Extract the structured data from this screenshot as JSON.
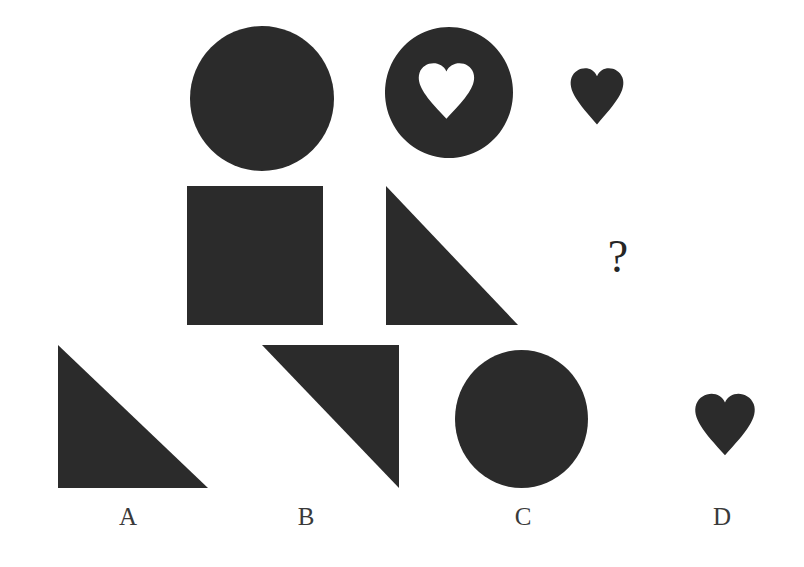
{
  "page": {
    "width": 804,
    "height": 567,
    "background": "#ffffff",
    "ink_color": "#2b2b2b",
    "label_color": "#3a3a3a",
    "question_mark": "?",
    "puzzle_type": "visual-analogy-matrix"
  },
  "matrix": {
    "rows": [
      {
        "row_index": 1,
        "cells": [
          {
            "name": "circle-solid",
            "shape": "circle",
            "fill": "#2b2b2b",
            "x": 190,
            "y": 26,
            "w": 144,
            "h": 145
          },
          {
            "name": "circle-with-heart-hole",
            "shape": "circle-donut-heart",
            "fill": "#2b2b2b",
            "x": 385,
            "y": 27,
            "w": 128,
            "h": 131
          },
          {
            "name": "heart-small",
            "shape": "heart",
            "fill": "#2b2b2b",
            "x": 566,
            "y": 62,
            "w": 62,
            "h": 65
          }
        ]
      },
      {
        "row_index": 2,
        "cells": [
          {
            "name": "square-solid",
            "shape": "square",
            "fill": "#2b2b2b",
            "x": 187,
            "y": 186,
            "w": 136,
            "h": 139
          },
          {
            "name": "triangle-left-vertical",
            "shape": "triangle-bottom-left",
            "fill": "#2b2b2b",
            "x": 386,
            "y": 186,
            "w": 132,
            "h": 139
          },
          {
            "name": "missing-cell-question-mark",
            "shape": "question-mark",
            "fill": "#262626",
            "x": 603,
            "y": 234,
            "w": 30,
            "h": 48
          }
        ]
      }
    ]
  },
  "options": {
    "items": [
      {
        "key": "A",
        "label": "A",
        "shape_name": "triangle-bottom-left",
        "shape": "triangle-bottom-left",
        "fill": "#2b2b2b",
        "x": 58,
        "y": 345,
        "w": 150,
        "h": 143,
        "label_x": 128,
        "label_y": 504
      },
      {
        "key": "B",
        "label": "B",
        "shape_name": "triangle-top-right",
        "shape": "triangle-top-right",
        "fill": "#2b2b2b",
        "x": 262,
        "y": 345,
        "w": 137,
        "h": 143,
        "label_x": 306,
        "label_y": 504
      },
      {
        "key": "C",
        "label": "C",
        "shape_name": "circle-solid",
        "shape": "circle",
        "fill": "#2b2b2b",
        "x": 455,
        "y": 350,
        "w": 133,
        "h": 138,
        "label_x": 523,
        "label_y": 504
      },
      {
        "key": "D",
        "label": "D",
        "shape_name": "heart-solid",
        "shape": "heart",
        "fill": "#2b2b2b",
        "x": 690,
        "y": 387,
        "w": 70,
        "h": 71,
        "label_x": 722,
        "label_y": 504
      }
    ]
  }
}
